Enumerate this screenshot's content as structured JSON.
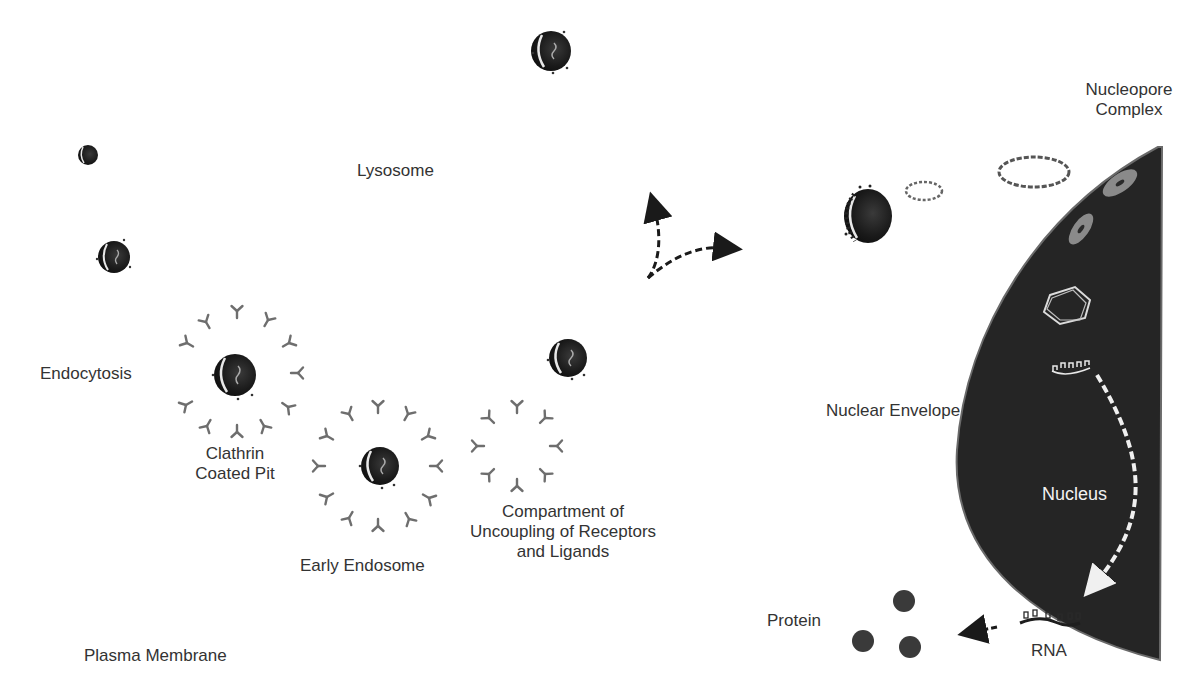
{
  "diagram": {
    "type": "cell-biology-pathway",
    "colors": {
      "background": "#ffffff",
      "nucleus_fill": "#252525",
      "vesicle_fill": "#1e1e1e",
      "receptor": "#6e6e6e",
      "pore_light": "#8a8a8a",
      "label_text": "#333333",
      "nucleus_label": "#f2f2f2",
      "protein": "#3a3a3a"
    }
  },
  "labels": {
    "lysosome": "Lysosome",
    "endocytosis": "Endocytosis",
    "clathrin_coated_pit": "Clathrin\nCoated Pit",
    "early_endosome": "Early Endosome",
    "curl": "Compartment of\nUncoupling of Receptors\nand Ligands",
    "plasma_membrane": "Plasma Membrane",
    "nucleopore_complex": "Nucleopore\nComplex",
    "nuclear_envelope": "Nuclear Envelope",
    "nucleus": "Nucleus",
    "protein": "Protein",
    "rna": "RNA"
  },
  "elements": {
    "vesicles": [
      {
        "name": "vesicle-top",
        "cx": 551,
        "cy": 51,
        "r": 20
      },
      {
        "name": "vesicle-small",
        "cx": 88,
        "cy": 155,
        "r": 10
      },
      {
        "name": "vesicle-left",
        "cx": 114,
        "cy": 257,
        "r": 16
      },
      {
        "name": "vesicle-clathrin-pit",
        "cx": 235,
        "cy": 375,
        "r": 21
      },
      {
        "name": "vesicle-early-endosome",
        "cx": 380,
        "cy": 466,
        "r": 19
      },
      {
        "name": "vesicle-curl",
        "cx": 568,
        "cy": 358,
        "r": 19
      },
      {
        "name": "vesicle-near-nucleus",
        "cx": 868,
        "cy": 216,
        "r": 26
      }
    ],
    "receptor_rings": [
      {
        "name": "clathrin-pit-receptors",
        "cx": 237,
        "cy": 373,
        "r": 62,
        "count": 12
      },
      {
        "name": "early-endosome-receptors",
        "cx": 378,
        "cy": 466,
        "r": 60,
        "count": 12
      },
      {
        "name": "curl-receptors",
        "cx": 517,
        "cy": 445,
        "r": 40,
        "count": 8
      }
    ],
    "proteins": [
      {
        "cx": 904,
        "cy": 601,
        "r": 11
      },
      {
        "cx": 863,
        "cy": 641,
        "r": 11
      },
      {
        "cx": 910,
        "cy": 647,
        "r": 11
      }
    ]
  }
}
